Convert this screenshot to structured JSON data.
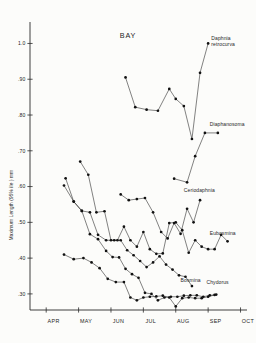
{
  "figure": {
    "title": "BAY",
    "background_color": "#fcfcfa",
    "ink_color": "#111111"
  },
  "chart_data": {
    "type": "line",
    "title": "BAY",
    "xlabel": "",
    "ylabel": "Maximum Length (95% ile ) mm",
    "xlim": [
      3.5,
      10.2
    ],
    "ylim": [
      0.255,
      1.06
    ],
    "grid": false,
    "legend": "inline-right-of-series",
    "marker": "filled-circle",
    "xtick_labels": [
      "APR",
      "MAY",
      "JUN",
      "JUL",
      "AUG",
      "SEP",
      "OCT"
    ],
    "xtick_values": [
      4,
      5,
      6,
      7,
      8,
      9,
      10
    ],
    "ytick_labels": [
      "1.0",
      ".90",
      ".80",
      ".70",
      ".60",
      ".50",
      ".40",
      ".30"
    ],
    "ytick_values": [
      1.0,
      0.9,
      0.8,
      0.7,
      0.6,
      0.5,
      0.4,
      0.3
    ],
    "series": [
      {
        "name": "Daphnia retrocurva",
        "label_lines": [
          "Daphnia",
          "retrocurva"
        ],
        "x": [
          6.45,
          6.75,
          7.1,
          7.45,
          7.8,
          8.0,
          8.25,
          8.5,
          8.75,
          9.0
        ],
        "values": [
          0.905,
          0.822,
          0.815,
          0.812,
          0.873,
          0.845,
          0.825,
          0.733,
          0.918,
          1.0
        ]
      },
      {
        "name": "Diaphanosoma",
        "label_lines": [
          "Diaphanosoma"
        ],
        "x": [
          7.95,
          8.35,
          8.6,
          8.9,
          9.3
        ],
        "values": [
          0.622,
          0.612,
          0.685,
          0.75,
          0.75
        ]
      },
      {
        "name": "Ceriodaphnia",
        "label_lines": [
          "Ceriodaphnia"
        ],
        "x": [
          6.3,
          6.55,
          6.8,
          7.05,
          7.3,
          7.55,
          7.75,
          7.95,
          8.15,
          8.35,
          8.55,
          8.75
        ],
        "values": [
          0.578,
          0.562,
          0.565,
          0.568,
          0.528,
          0.473,
          0.455,
          0.498,
          0.468,
          0.538,
          0.5,
          0.562
        ]
      },
      {
        "name": "Eubosmina",
        "label_lines": [
          "Eubosmina"
        ],
        "x": [
          5.05,
          5.3,
          5.55,
          5.8,
          6.0,
          6.2,
          6.4,
          6.6,
          6.8,
          7.0,
          7.2,
          7.4,
          7.6,
          7.8,
          8.0,
          8.2,
          8.4,
          8.6,
          8.8,
          9.0,
          9.2
        ],
        "values": [
          0.67,
          0.633,
          0.528,
          0.531,
          0.45,
          0.45,
          0.488,
          0.45,
          0.432,
          0.473,
          0.425,
          0.412,
          0.413,
          0.498,
          0.5,
          0.478,
          0.415,
          0.45,
          0.432,
          0.425,
          0.425
        ],
        "tail_x": [
          9.4,
          9.6
        ],
        "tail_values": [
          0.465,
          0.447
        ]
      },
      {
        "name": "Bosmina",
        "label_lines": [
          "Bosmina"
        ],
        "x": [
          4.6,
          4.85,
          5.1,
          5.35,
          5.6,
          5.85,
          6.1,
          6.3,
          6.5,
          6.7,
          6.9,
          7.1,
          7.3,
          7.5,
          7.7,
          7.9,
          8.1,
          8.3,
          8.5
        ],
        "values": [
          0.623,
          0.558,
          0.532,
          0.528,
          0.465,
          0.45,
          0.45,
          0.45,
          0.422,
          0.408,
          0.392,
          0.375,
          0.388,
          0.405,
          0.382,
          0.368,
          0.352,
          0.348,
          0.322
        ]
      },
      {
        "name": "Chydorus",
        "label_lines": [
          "Chydorus"
        ],
        "x": [
          4.55,
          4.85,
          5.1,
          5.35,
          5.6,
          5.85,
          6.05,
          6.25,
          6.45,
          6.65,
          6.85,
          7.05,
          7.25,
          7.45,
          7.65,
          7.85,
          8.05,
          8.25,
          8.45,
          8.65,
          8.85,
          9.05,
          9.25
        ],
        "values": [
          0.603,
          0.558,
          0.532,
          0.467,
          0.453,
          0.42,
          0.403,
          0.402,
          0.37,
          0.355,
          0.345,
          0.303,
          0.3,
          0.282,
          0.29,
          0.292,
          0.292,
          0.295,
          0.296,
          0.296,
          0.292,
          0.296,
          0.298
        ],
        "secondary_x": [
          4.55,
          4.85,
          5.15,
          5.4,
          5.65,
          5.9,
          6.15,
          6.4,
          6.6,
          6.8,
          7.0,
          7.2,
          7.4,
          7.6,
          7.8,
          8.0,
          8.2,
          8.4,
          8.6,
          8.8,
          9.0,
          9.2
        ],
        "secondary_values": [
          0.41,
          0.397,
          0.4,
          0.388,
          0.372,
          0.342,
          0.333,
          0.333,
          0.29,
          0.282,
          0.29,
          0.292,
          0.293,
          0.295,
          0.29,
          0.265,
          0.288,
          0.29,
          0.288,
          0.288,
          0.292,
          0.297
        ]
      }
    ],
    "series_labels_positions": [
      {
        "name": "Daphnia retrocurva",
        "anchor_x": 9.1,
        "anchor_y": 1.01
      },
      {
        "name": "Diaphanosoma",
        "anchor_x": 9.05,
        "anchor_y": 0.768
      },
      {
        "name": "Ceriodaphnia",
        "anchor_x": 8.25,
        "anchor_y": 0.585
      },
      {
        "name": "Eubosmina",
        "anchor_x": 9.05,
        "anchor_y": 0.465
      },
      {
        "name": "Bosmina",
        "anchor_x": 8.15,
        "anchor_y": 0.333
      },
      {
        "name": "Chydorus",
        "anchor_x": 8.95,
        "anchor_y": 0.327
      }
    ]
  }
}
